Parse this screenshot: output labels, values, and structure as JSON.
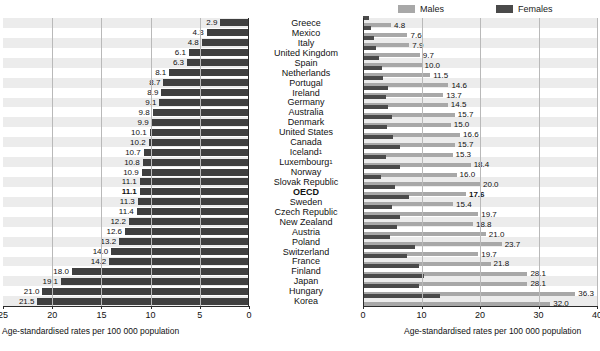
{
  "legend": {
    "males_label": "Males",
    "females_label": "Females",
    "males_color": "#a8a8a8",
    "females_color": "#4a4a4a"
  },
  "axes": {
    "left_caption": "Age-standardised rates per 100 000 population",
    "right_caption": "Age-standardised rates per 100 000 population",
    "left_ticks": [
      "25",
      "20",
      "15",
      "10",
      "5",
      "0"
    ],
    "right_ticks": [
      "0",
      "10",
      "20",
      "30",
      "40"
    ]
  },
  "chart_data": {
    "type": "bar",
    "title": "",
    "xlabel": "Age-standardised rates per 100 000 population",
    "ylabel": "",
    "left_panel": {
      "name": "Total",
      "xlim": [
        25,
        0
      ],
      "reversed": true,
      "grid": true
    },
    "right_panel": {
      "name": "By sex",
      "xlim": [
        0,
        40
      ],
      "grid": true,
      "series": [
        {
          "name": "Males",
          "color": "#a8a8a8"
        },
        {
          "name": "Females",
          "color": "#4a4a4a"
        }
      ]
    },
    "categories": [
      "Greece",
      "Mexico",
      "Italy",
      "United Kingdom",
      "Spain",
      "Netherlands",
      "Portugal",
      "Ireland",
      "Germany",
      "Australia",
      "Denmark",
      "United States",
      "Canada",
      "Iceland",
      "Luxembourg",
      "Norway",
      "Slovak Republic",
      "OECD",
      "Sweden",
      "Czech Republic",
      "New Zealand",
      "Austria",
      "Poland",
      "Switzerland",
      "France",
      "Finland",
      "Japan",
      "Hungary",
      "Korea"
    ],
    "category_footnotes": {
      "Iceland": "1",
      "Luxembourg": "1"
    },
    "highlight_category": "OECD",
    "total": [
      2.9,
      4.3,
      4.8,
      6.1,
      6.3,
      8.1,
      8.7,
      8.9,
      9.1,
      9.8,
      9.9,
      10.1,
      10.2,
      10.7,
      10.8,
      10.9,
      11.1,
      11.3,
      11.4,
      12.2,
      12.6,
      13.2,
      14.0,
      14.2,
      18.0,
      19.1,
      21.0,
      21.5
    ],
    "males": [
      4.8,
      7.6,
      7.9,
      9.7,
      10.0,
      11.5,
      14.6,
      13.7,
      14.5,
      15.7,
      15.0,
      16.6,
      15.7,
      15.3,
      18.4,
      16.0,
      20.0,
      17.6,
      15.4,
      19.7,
      18.8,
      21.0,
      23.7,
      19.7,
      21.8,
      28.1,
      28.1,
      36.3,
      32.0
    ],
    "females": [
      1.0,
      1.3,
      1.9,
      2.3,
      2.7,
      3.2,
      3.5,
      4.3,
      4.0,
      4.3,
      5.0,
      4.1,
      5.1,
      6.4,
      3.9,
      6.3,
      3.0,
      5.4,
      7.8,
      5.0,
      6.4,
      5.8,
      4.6,
      8.9,
      7.6,
      9.5,
      10.5,
      9.6,
      13.2
    ]
  },
  "rows": [
    {
      "country": "Greece",
      "footnote": "",
      "total": "2.9",
      "male": "4.8",
      "female": "",
      "total_v": 2.9,
      "male_v": 4.8,
      "female_v": 1.0
    },
    {
      "country": "Mexico",
      "footnote": "",
      "total": "4.3",
      "male": "7.6",
      "female": "",
      "total_v": 4.3,
      "male_v": 7.6,
      "female_v": 1.3
    },
    {
      "country": "Italy",
      "footnote": "",
      "total": "4.8",
      "male": "7.9",
      "female": "",
      "total_v": 4.8,
      "male_v": 7.9,
      "female_v": 1.9
    },
    {
      "country": "United Kingdom",
      "footnote": "",
      "total": "6.1",
      "male": "9.7",
      "female": "",
      "total_v": 6.1,
      "male_v": 9.7,
      "female_v": 2.3
    },
    {
      "country": "Spain",
      "footnote": "",
      "total": "6.3",
      "male": "10.0",
      "female": "",
      "total_v": 6.3,
      "male_v": 10.0,
      "female_v": 2.7
    },
    {
      "country": "Netherlands",
      "footnote": "",
      "total": "8.1",
      "male": "11.5",
      "female": "",
      "total_v": 8.1,
      "male_v": 11.5,
      "female_v": 3.2
    },
    {
      "country": "Portugal",
      "footnote": "",
      "total": "8.7",
      "male": "14.6",
      "female": "",
      "total_v": 8.7,
      "male_v": 14.6,
      "female_v": 3.5
    },
    {
      "country": "Ireland",
      "footnote": "",
      "total": "8.9",
      "male": "13.7",
      "female": "",
      "total_v": 8.9,
      "male_v": 13.7,
      "female_v": 4.3
    },
    {
      "country": "Germany",
      "footnote": "",
      "total": "9.1",
      "male": "14.5",
      "female": "",
      "total_v": 9.1,
      "male_v": 14.5,
      "female_v": 4.0
    },
    {
      "country": "Australia",
      "footnote": "",
      "total": "9.8",
      "male": "15.7",
      "female": "",
      "total_v": 9.8,
      "male_v": 15.7,
      "female_v": 4.3
    },
    {
      "country": "Denmark",
      "footnote": "",
      "total": "9.9",
      "male": "15.0",
      "female": "",
      "total_v": 9.9,
      "male_v": 15.0,
      "female_v": 5.0
    },
    {
      "country": "United States",
      "footnote": "",
      "total": "10.1",
      "male": "16.6",
      "female": "",
      "total_v": 10.1,
      "male_v": 16.6,
      "female_v": 4.1
    },
    {
      "country": "Canada",
      "footnote": "",
      "total": "10.2",
      "male": "15.7",
      "female": "",
      "total_v": 10.2,
      "male_v": 15.7,
      "female_v": 5.1
    },
    {
      "country": "Iceland",
      "footnote": "1",
      "total": "10.7",
      "male": "15.3",
      "female": "",
      "total_v": 10.7,
      "male_v": 15.3,
      "female_v": 6.4
    },
    {
      "country": "Luxembourg",
      "footnote": "1",
      "total": "10.8",
      "male": "18.4",
      "female": "",
      "total_v": 10.8,
      "male_v": 18.4,
      "female_v": 3.9
    },
    {
      "country": "Norway",
      "footnote": "",
      "total": "10.9",
      "male": "16.0",
      "female": "",
      "total_v": 10.9,
      "male_v": 16.0,
      "female_v": 6.3
    },
    {
      "country": "Slovak Republic",
      "footnote": "",
      "total": "11.1",
      "male": "20.0",
      "female": "",
      "total_v": 11.1,
      "male_v": 20.0,
      "female_v": 3.0
    },
    {
      "country": "OECD",
      "footnote": "",
      "total": "11.1",
      "male": "17.6",
      "female": "",
      "total_v": 11.1,
      "male_v": 17.6,
      "female_v": 5.4
    },
    {
      "country": "Sweden",
      "footnote": "",
      "total": "11.3",
      "male": "15.4",
      "female": "",
      "total_v": 11.3,
      "male_v": 15.4,
      "female_v": 7.8
    },
    {
      "country": "Czech Republic",
      "footnote": "",
      "total": "11.4",
      "male": "19.7",
      "female": "",
      "total_v": 11.4,
      "male_v": 19.7,
      "female_v": 5.0
    },
    {
      "country": "New Zealand",
      "footnote": "",
      "total": "12.2",
      "male": "18.8",
      "female": "",
      "total_v": 12.2,
      "male_v": 18.8,
      "female_v": 6.4
    },
    {
      "country": "Austria",
      "footnote": "",
      "total": "12.6",
      "male": "21.0",
      "female": "",
      "total_v": 12.6,
      "male_v": 21.0,
      "female_v": 5.8
    },
    {
      "country": "Poland",
      "footnote": "",
      "total": "13.2",
      "male": "23.7",
      "female": "",
      "total_v": 13.2,
      "male_v": 23.7,
      "female_v": 4.6
    },
    {
      "country": "Switzerland",
      "footnote": "",
      "total": "14.0",
      "male": "19.7",
      "female": "",
      "total_v": 14.0,
      "male_v": 19.7,
      "female_v": 8.9
    },
    {
      "country": "France",
      "footnote": "",
      "total": "14.2",
      "male": "21.8",
      "female": "",
      "total_v": 14.2,
      "male_v": 21.8,
      "female_v": 7.6
    },
    {
      "country": "Finland",
      "footnote": "",
      "total": "18.0",
      "male": "28.1",
      "female": "",
      "total_v": 18.0,
      "male_v": 28.1,
      "female_v": 9.5
    },
    {
      "country": "Japan",
      "footnote": "",
      "total": "19.1",
      "male": "28.1",
      "female": "",
      "total_v": 19.1,
      "male_v": 28.1,
      "female_v": 10.5
    },
    {
      "country": "Hungary",
      "footnote": "",
      "total": "21.0",
      "male": "36.3",
      "female": "",
      "total_v": 21.0,
      "male_v": 36.3,
      "female_v": 9.6
    },
    {
      "country": "Korea",
      "footnote": "",
      "total": "21.5",
      "male": "32.0",
      "female": "",
      "total_v": 21.5,
      "male_v": 32.0,
      "female_v": 13.2
    }
  ]
}
